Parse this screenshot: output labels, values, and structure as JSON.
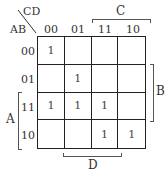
{
  "kmap": {
    "row_var": "AB",
    "col_var": "CD",
    "col_headers": [
      "00",
      "01",
      "11",
      "10"
    ],
    "row_headers": [
      "00",
      "01",
      "11",
      "10"
    ],
    "cells": [
      [
        "1",
        "",
        "",
        ""
      ],
      [
        "",
        "1",
        "",
        ""
      ],
      [
        "1",
        "1",
        "1",
        ""
      ],
      [
        "",
        "",
        "1",
        "1"
      ]
    ],
    "brackets": {
      "C": "C",
      "B": "B",
      "A": "A",
      "D": "D"
    }
  }
}
